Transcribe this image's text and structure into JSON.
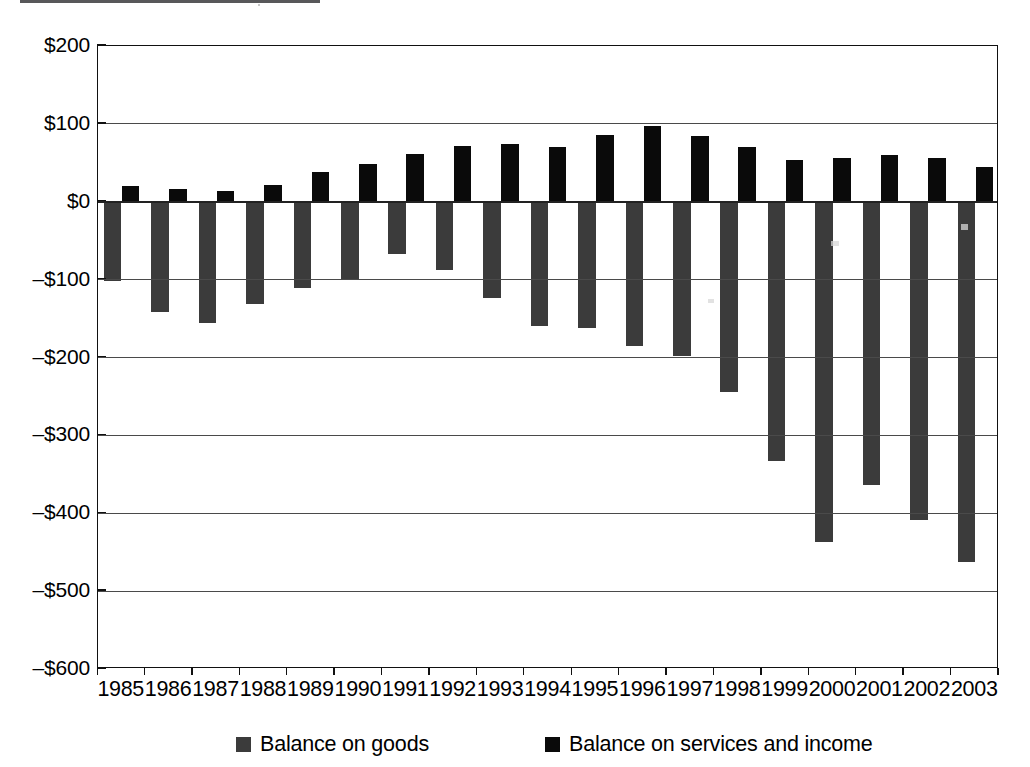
{
  "chart_data": {
    "type": "bar",
    "title": "",
    "xlabel": "",
    "ylabel": "",
    "ylim": [
      -600,
      200
    ],
    "ytick_values": [
      200,
      100,
      0,
      -100,
      -200,
      -300,
      -400,
      -500,
      -600
    ],
    "ytick_labels": [
      "$200",
      "$100",
      "$0",
      "–$100",
      "–$200",
      "–$300",
      "–$400",
      "–$500",
      "–$600"
    ],
    "grid": true,
    "legend_position": "bottom",
    "categories": [
      "1985",
      "1986",
      "1987",
      "1988",
      "1989",
      "1990",
      "1991",
      "1992",
      "1993",
      "1994",
      "1995",
      "1996",
      "1997",
      "1998",
      "1999",
      "2000",
      "2001",
      "2002",
      "2003"
    ],
    "series": [
      {
        "name": "Balance on goods",
        "color": "#3b3b3b",
        "values": [
          -102,
          -142,
          -156,
          -131,
          -111,
          -99,
          -67,
          -88,
          -124,
          -159,
          -162,
          -185,
          -198,
          -244,
          -333,
          -437,
          -364,
          -409,
          -463
        ]
      },
      {
        "name": "Balance on services and income",
        "color": "#0a0a0a",
        "values": [
          20,
          16,
          14,
          22,
          38,
          48,
          61,
          71,
          74,
          70,
          86,
          97,
          84,
          70,
          54,
          56,
          60,
          56,
          45
        ]
      }
    ]
  },
  "legend": {
    "items": [
      {
        "label": "Balance on goods",
        "swatch": "goods"
      },
      {
        "label": "Balance on services and income",
        "swatch": "services"
      }
    ]
  }
}
